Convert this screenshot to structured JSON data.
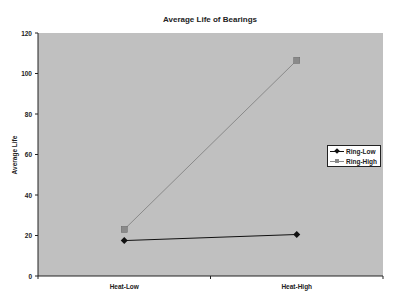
{
  "chart_data": {
    "type": "line",
    "title": "Average Life of Bearings",
    "xlabel": "",
    "ylabel": "Average Life",
    "categories": [
      "Heat-Low",
      "Heat-High"
    ],
    "series": [
      {
        "name": "Ring-Low",
        "values": [
          17.5,
          20.5
        ],
        "color": "#111111",
        "marker": "diamond"
      },
      {
        "name": "Ring-High",
        "values": [
          23,
          106.5
        ],
        "color": "#8a8a8a",
        "marker": "square"
      }
    ],
    "ylim": [
      0,
      120
    ],
    "yticks": [
      0,
      20,
      40,
      60,
      80,
      100,
      120
    ],
    "grid": false,
    "legend_position": "right",
    "plot_background": "#c0c0c0"
  },
  "legend": {
    "items": [
      {
        "label": "Ring-Low"
      },
      {
        "label": "Ring-High"
      }
    ]
  }
}
